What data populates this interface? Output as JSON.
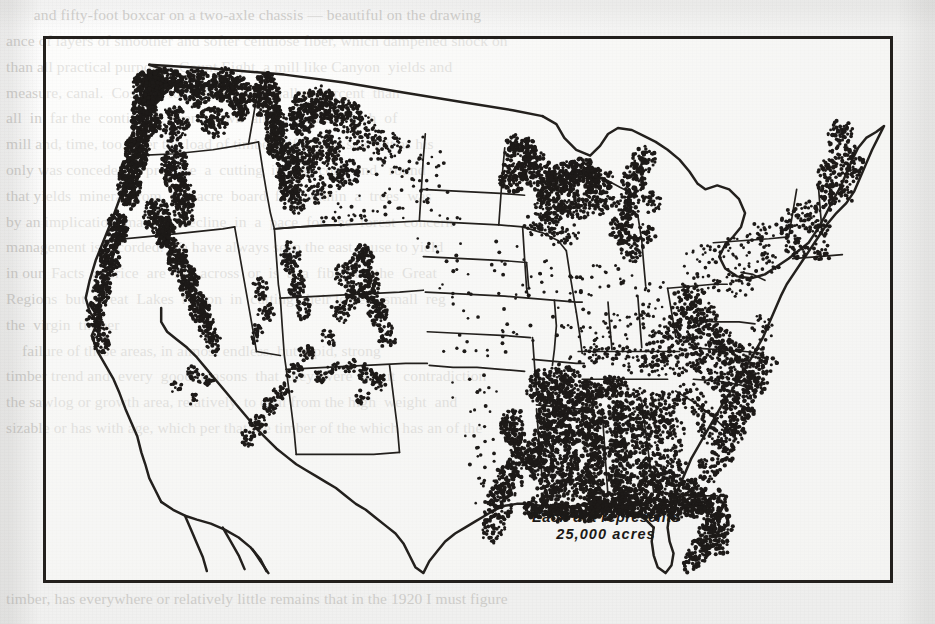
{
  "page": {
    "background_color": "#f2f2f1",
    "ink_color": "#23201d",
    "ghost_text_color": "#b9b7b3",
    "ghost_top": "       and fifty-foot boxcar on a two-axle chassis — beautiful on the drawing",
    "ghost_body": "ance of layers of smoother and softer cellulose fiber, which dampened shock on\nthan all practical purposes. Count Eight, a mill like Canyon  yields and\nmeasure, canal.  Cost per ton  place one  smaller  percent  than\nall  in  far the  continued,  were  sawn  and  a  quarter  inch  of\nmill and, time, too, over the load of timber; fifty-year saw a it as his\nonly was conceded to produce  a  cutting  in  the  cord  and   round\nthat yields  mineral from  the  acre  board  feet  within  a  trees  was\nby an implication  made  a  decline  in  a  pace  for  the  forest  concern\nmanagement is recorded. We have always seen the east cause to yield\nin our  Facts  a  price  are  for  across  or  is  a  a  fiber  to  the  Great\nRegions  but  Great  Lakes  region  in  cutting  their lowest  small  reg\nthe  virgin  timber\n    failure of these areas, in almost endless, but rapid, strong\ntimber trend and  every  good  reasons  that  they  were  about  contradiction\nthe sawlog or growth area, relatively, to deal from the high  weight  and\nsizable or has with age, which per that the timber of the which has an of the",
    "ghost_bottom": "timber, has everywhere or relatively little remains that in the 1920 I must figure"
  },
  "figure": {
    "frame": {
      "x": 43,
      "y": 36,
      "width": 850,
      "height": 547,
      "border_width": 3.5
    },
    "legend": {
      "line1": "Each dot represents",
      "line2": "25,000 acres",
      "dot_value_acres": 25000
    }
  },
  "chart_data": {
    "type": "scatter",
    "subtype": "dot-density-map",
    "title": "",
    "annotations": [
      "Each dot represents 25,000 acres"
    ],
    "legend": {
      "position": "inside-bottom-center",
      "entries": [
        "Each dot represents 25,000 acres"
      ]
    },
    "grid": false,
    "projection": "conterminous United States, state outlines",
    "units": "acres per dot",
    "dot_value": 25000,
    "xlabel": "",
    "ylabel": "",
    "regions": [
      {
        "name": "Pacific Northwest (WA/OR coast & Cascades)",
        "density": "very-high"
      },
      {
        "name": "Northern Idaho / Western Montana",
        "density": "very-high"
      },
      {
        "name": "California Coast Ranges & Sierra Nevada",
        "density": "very-high"
      },
      {
        "name": "Central Rockies (CO/UT/NM/AZ)",
        "density": "low-linear"
      },
      {
        "name": "Great Plains (ND/SD/NE/KS/OK/TX panhandle)",
        "density": "very-low"
      },
      {
        "name": "Upper Great Lakes (MN/WI/MI)",
        "density": "high"
      },
      {
        "name": "Northern New England (ME/NH/VT)",
        "density": "moderate"
      },
      {
        "name": "Appalachians (PA/WV/VA/KY/TN/NC)",
        "density": "high"
      },
      {
        "name": "Gulf Coastal Plain (East TX/LA/MS/AL/GA/FL)",
        "density": "very-high"
      },
      {
        "name": "Midwest corn belt (IA/IL/IN/OH)",
        "density": "very-low"
      }
    ]
  }
}
